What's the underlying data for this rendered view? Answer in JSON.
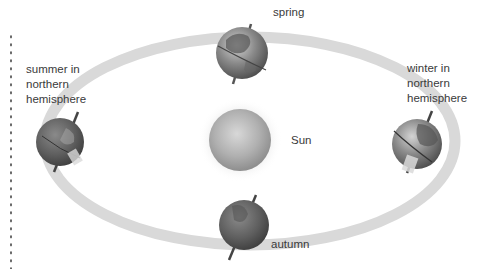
{
  "diagram": {
    "center_body": {
      "label": "Sun",
      "color": "#a8a8a8"
    },
    "orbit": {
      "color": "#d9d9d9"
    },
    "positions": [
      {
        "id": "spring",
        "label": "spring"
      },
      {
        "id": "summer",
        "label": "summer in\nnorthern\nhemisphere"
      },
      {
        "id": "autumn",
        "label": "autumn"
      },
      {
        "id": "winter",
        "label": "winter in\nnorthern\nhemisphere"
      }
    ]
  }
}
